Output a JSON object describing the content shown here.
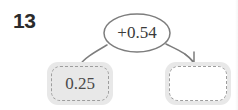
{
  "question": {
    "number": "13"
  },
  "diagram": {
    "type": "function-machine",
    "operation": {
      "label": "+0.54",
      "shape": "oval",
      "operator": "+",
      "operand": "0.54"
    },
    "start_box": {
      "value": "0.25",
      "filled": true
    },
    "answer_box": {
      "value": "",
      "filled": false
    },
    "connectors": [
      {
        "name": "input-connector",
        "from": "start-box",
        "to": "operation-oval",
        "arrowhead": false
      },
      {
        "name": "output-arrow",
        "from": "operation-oval",
        "to": "answer-box",
        "arrowhead": true
      }
    ]
  },
  "colors": {
    "number_text": "#2b2b2b",
    "box_fill": "#e8e8e8",
    "box_dash_border": "#9d9d9d",
    "answer_interior": "#ffffff",
    "value_text": "#4a4a4a",
    "oval_stroke": "#7d7d7d",
    "connector_stroke": "#7d7d7d",
    "page_background": "#ffffff"
  }
}
